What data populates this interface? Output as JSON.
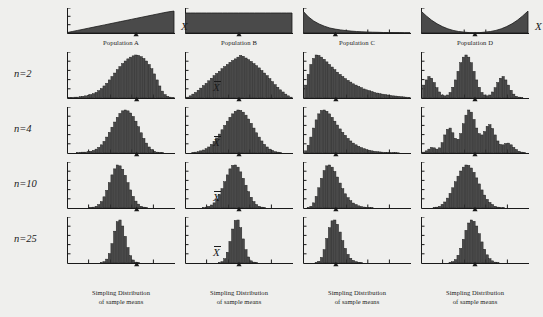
{
  "figure": {
    "background_color": "#efefed",
    "ink_color": "#1a1a1a",
    "fill_color": "#4a4a4a",
    "x_axis_label": "X",
    "mean_label": "X",
    "row_labels": [
      "n=2",
      "n=4",
      "n=10",
      "n=25"
    ],
    "sample_sizes": [
      2,
      4,
      10,
      25
    ],
    "caption_line1": "Simpling Distribution",
    "caption_line2": "of sample means"
  },
  "chart_data": [
    {
      "type": "area",
      "title": "Population A",
      "shape": "triangular-increasing",
      "xlabel": "X",
      "ylabel": "",
      "grid": false,
      "legend": "none",
      "x": [
        0,
        1,
        2,
        3,
        4,
        5,
        6,
        7,
        8,
        9,
        10,
        11,
        12,
        13,
        14,
        15,
        16,
        17,
        18,
        19,
        20
      ],
      "values": [
        0.02,
        0.07,
        0.12,
        0.17,
        0.22,
        0.27,
        0.32,
        0.37,
        0.42,
        0.47,
        0.52,
        0.57,
        0.62,
        0.67,
        0.72,
        0.77,
        0.82,
        0.87,
        0.92,
        0.97,
        1.0
      ],
      "mean_marker_x": 0.64,
      "xlim": [
        0,
        20
      ],
      "ylim": [
        0,
        1.05
      ]
    },
    {
      "type": "area",
      "title": "Population B",
      "shape": "uniform-rectangular",
      "xlabel": "X",
      "ylabel": "",
      "grid": false,
      "legend": "none",
      "x": [
        0,
        1,
        2,
        3,
        4,
        5,
        6,
        7,
        8,
        9,
        10,
        11,
        12,
        13,
        14,
        15,
        16,
        17,
        18,
        19,
        20
      ],
      "values": [
        1,
        1,
        1,
        1,
        1,
        1,
        1,
        1,
        1,
        1,
        1,
        1,
        1,
        1,
        1,
        1,
        1,
        1,
        1,
        1,
        1
      ],
      "mean_marker_x": 0.5,
      "xlim": [
        0,
        20
      ],
      "ylim": [
        0,
        1.15
      ]
    },
    {
      "type": "area",
      "title": "Population C",
      "shape": "exponential-decay",
      "xlabel": "X",
      "ylabel": "",
      "grid": false,
      "legend": "none",
      "x": [
        0,
        1,
        2,
        3,
        4,
        5,
        6,
        7,
        8,
        9,
        10,
        11,
        12,
        13,
        14,
        15,
        16,
        17,
        18,
        19,
        20
      ],
      "values": [
        1.0,
        0.74,
        0.55,
        0.41,
        0.31,
        0.23,
        0.18,
        0.14,
        0.11,
        0.085,
        0.067,
        0.054,
        0.044,
        0.036,
        0.03,
        0.025,
        0.022,
        0.019,
        0.017,
        0.015,
        0.014
      ],
      "mean_marker_x": 0.3,
      "xlim": [
        0,
        20
      ],
      "ylim": [
        0,
        1.05
      ]
    },
    {
      "type": "area",
      "title": "Population D",
      "shape": "u-shaped-bimodal",
      "xlabel": "X",
      "ylabel": "",
      "grid": false,
      "legend": "none",
      "x": [
        0,
        1,
        2,
        3,
        4,
        5,
        6,
        7,
        8,
        9,
        10,
        11,
        12,
        13,
        14,
        15,
        16,
        17,
        18,
        19,
        20
      ],
      "values": [
        1.0,
        0.78,
        0.58,
        0.42,
        0.29,
        0.19,
        0.12,
        0.07,
        0.04,
        0.02,
        0.015,
        0.02,
        0.04,
        0.07,
        0.12,
        0.19,
        0.29,
        0.42,
        0.58,
        0.78,
        1.0
      ],
      "mean_marker_x": 0.5,
      "xlim": [
        0,
        20
      ],
      "ylim": [
        0,
        1.05
      ]
    },
    {
      "type": "bar",
      "title": "Sampling distribution, Population A, n=2",
      "population": "A",
      "n": 2,
      "xlabel": "X",
      "ylabel": "",
      "grid": false,
      "legend": "none",
      "mean_marker_x": 0.645,
      "values": [
        0.01,
        0.01,
        0.02,
        0.02,
        0.03,
        0.04,
        0.05,
        0.06,
        0.08,
        0.1,
        0.13,
        0.17,
        0.22,
        0.28,
        0.34,
        0.42,
        0.5,
        0.58,
        0.66,
        0.73,
        0.8,
        0.86,
        0.91,
        0.95,
        0.98,
        1.0,
        0.99,
        0.96,
        0.92,
        0.86,
        0.78,
        0.68,
        0.56,
        0.42,
        0.28,
        0.16,
        0.08,
        0.04,
        0.02,
        0.01
      ]
    },
    {
      "type": "bar",
      "title": "Sampling distribution, Population A, n=4",
      "population": "A",
      "n": 4,
      "xlabel": "X",
      "ylabel": "",
      "grid": false,
      "legend": "none",
      "mean_marker_x": 0.645,
      "values": [
        0.0,
        0.0,
        0.0,
        0.01,
        0.01,
        0.02,
        0.02,
        0.03,
        0.04,
        0.06,
        0.09,
        0.13,
        0.19,
        0.27,
        0.37,
        0.48,
        0.6,
        0.72,
        0.83,
        0.92,
        0.98,
        1.0,
        0.98,
        0.93,
        0.85,
        0.74,
        0.61,
        0.47,
        0.34,
        0.23,
        0.14,
        0.08,
        0.04,
        0.02,
        0.01,
        0.01,
        0.0,
        0.0,
        0.0,
        0.0
      ]
    },
    {
      "type": "bar",
      "title": "Sampling distribution, Population A, n=10",
      "population": "A",
      "n": 10,
      "xlabel": "X",
      "ylabel": "",
      "grid": false,
      "legend": "none",
      "mean_marker_x": 0.645,
      "values": [
        0.0,
        0.0,
        0.0,
        0.0,
        0.0,
        0.0,
        0.0,
        0.0,
        0.01,
        0.02,
        0.04,
        0.08,
        0.15,
        0.26,
        0.41,
        0.59,
        0.77,
        0.91,
        1.0,
        0.98,
        0.9,
        0.76,
        0.59,
        0.42,
        0.27,
        0.16,
        0.09,
        0.04,
        0.02,
        0.01,
        0.0,
        0.0,
        0.0,
        0.0,
        0.0,
        0.0,
        0.0,
        0.0,
        0.0,
        0.0
      ]
    },
    {
      "type": "bar",
      "title": "Sampling distribution, Population A, n=25",
      "population": "A",
      "n": 25,
      "xlabel": "X",
      "ylabel": "",
      "grid": false,
      "legend": "none",
      "mean_marker_x": 0.645,
      "values": [
        0.0,
        0.0,
        0.0,
        0.0,
        0.0,
        0.0,
        0.0,
        0.0,
        0.0,
        0.0,
        0.0,
        0.0,
        0.01,
        0.03,
        0.09,
        0.22,
        0.45,
        0.74,
        0.96,
        1.0,
        0.86,
        0.62,
        0.36,
        0.17,
        0.07,
        0.02,
        0.01,
        0.0,
        0.0,
        0.0,
        0.0,
        0.0,
        0.0,
        0.0,
        0.0,
        0.0,
        0.0,
        0.0,
        0.0,
        0.0
      ]
    },
    {
      "type": "bar",
      "title": "Sampling distribution, Population B, n=2",
      "population": "B",
      "n": 2,
      "xlabel": "X",
      "ylabel": "",
      "grid": false,
      "legend": "none",
      "mean_marker_x": 0.5,
      "values": [
        0.02,
        0.05,
        0.09,
        0.13,
        0.18,
        0.23,
        0.29,
        0.34,
        0.4,
        0.46,
        0.52,
        0.57,
        0.62,
        0.68,
        0.73,
        0.78,
        0.83,
        0.87,
        0.91,
        0.95,
        0.99,
        0.97,
        0.93,
        0.89,
        0.85,
        0.8,
        0.75,
        0.7,
        0.64,
        0.58,
        0.52,
        0.45,
        0.38,
        0.31,
        0.25,
        0.19,
        0.14,
        0.09,
        0.05,
        0.02
      ]
    },
    {
      "type": "bar",
      "title": "Sampling distribution, Population B, n=4",
      "population": "B",
      "n": 4,
      "xlabel": "X",
      "ylabel": "",
      "grid": false,
      "legend": "none",
      "mean_marker_x": 0.5,
      "values": [
        0.0,
        0.0,
        0.01,
        0.02,
        0.03,
        0.05,
        0.07,
        0.1,
        0.14,
        0.2,
        0.27,
        0.35,
        0.44,
        0.54,
        0.64,
        0.74,
        0.83,
        0.91,
        0.97,
        1.0,
        0.99,
        0.95,
        0.88,
        0.79,
        0.69,
        0.58,
        0.47,
        0.37,
        0.28,
        0.2,
        0.14,
        0.09,
        0.06,
        0.03,
        0.02,
        0.01,
        0.0,
        0.0,
        0.0,
        0.0
      ]
    },
    {
      "type": "bar",
      "title": "Sampling distribution, Population B, n=10",
      "population": "B",
      "n": 10,
      "xlabel": "X",
      "ylabel": "",
      "grid": false,
      "legend": "none",
      "mean_marker_x": 0.5,
      "values": [
        0.0,
        0.0,
        0.0,
        0.0,
        0.0,
        0.0,
        0.01,
        0.02,
        0.04,
        0.07,
        0.12,
        0.2,
        0.31,
        0.45,
        0.61,
        0.77,
        0.91,
        0.99,
        1.0,
        0.95,
        0.84,
        0.69,
        0.53,
        0.38,
        0.25,
        0.15,
        0.08,
        0.04,
        0.02,
        0.01,
        0.0,
        0.0,
        0.0,
        0.0,
        0.0,
        0.0,
        0.0,
        0.0,
        0.0,
        0.0
      ]
    },
    {
      "type": "bar",
      "title": "Sampling distribution, Population B, n=25",
      "population": "B",
      "n": 25,
      "xlabel": "X",
      "ylabel": "",
      "grid": false,
      "legend": "none",
      "mean_marker_x": 0.5,
      "values": [
        0.0,
        0.0,
        0.0,
        0.0,
        0.0,
        0.0,
        0.0,
        0.0,
        0.0,
        0.0,
        0.0,
        0.0,
        0.01,
        0.03,
        0.1,
        0.25,
        0.5,
        0.79,
        0.99,
        1.0,
        0.82,
        0.56,
        0.31,
        0.14,
        0.05,
        0.02,
        0.01,
        0.0,
        0.0,
        0.0,
        0.0,
        0.0,
        0.0,
        0.0,
        0.0,
        0.0,
        0.0,
        0.0,
        0.0,
        0.0
      ]
    },
    {
      "type": "bar",
      "title": "Sampling distribution, Population C, n=2",
      "population": "C",
      "n": 2,
      "xlabel": "X",
      "ylabel": "",
      "grid": false,
      "legend": "none",
      "mean_marker_x": 0.305,
      "values": [
        0.3,
        0.55,
        0.78,
        0.92,
        1.0,
        0.99,
        0.95,
        0.9,
        0.84,
        0.78,
        0.72,
        0.66,
        0.6,
        0.55,
        0.5,
        0.45,
        0.41,
        0.37,
        0.33,
        0.3,
        0.27,
        0.24,
        0.21,
        0.19,
        0.17,
        0.15,
        0.13,
        0.115,
        0.1,
        0.09,
        0.08,
        0.07,
        0.06,
        0.05,
        0.045,
        0.04,
        0.03,
        0.025,
        0.02,
        0.015
      ]
    },
    {
      "type": "bar",
      "title": "Sampling distribution, Population C, n=4",
      "population": "C",
      "n": 4,
      "xlabel": "X",
      "ylabel": "",
      "grid": false,
      "legend": "none",
      "mean_marker_x": 0.305,
      "values": [
        0.05,
        0.18,
        0.37,
        0.58,
        0.77,
        0.91,
        0.99,
        1.0,
        0.97,
        0.91,
        0.83,
        0.74,
        0.65,
        0.56,
        0.48,
        0.41,
        0.34,
        0.28,
        0.23,
        0.19,
        0.155,
        0.125,
        0.1,
        0.08,
        0.065,
        0.05,
        0.04,
        0.03,
        0.025,
        0.02,
        0.015,
        0.012,
        0.01,
        0.008,
        0.006,
        0.005,
        0.004,
        0.003,
        0.002,
        0.002
      ]
    },
    {
      "type": "bar",
      "title": "Sampling distribution, Population C, n=10",
      "population": "C",
      "n": 10,
      "xlabel": "X",
      "ylabel": "",
      "grid": false,
      "legend": "none",
      "mean_marker_x": 0.305,
      "values": [
        0.0,
        0.01,
        0.04,
        0.12,
        0.27,
        0.47,
        0.69,
        0.87,
        0.98,
        1.0,
        0.95,
        0.85,
        0.72,
        0.58,
        0.45,
        0.33,
        0.24,
        0.17,
        0.115,
        0.08,
        0.05,
        0.034,
        0.022,
        0.015,
        0.01,
        0.006,
        0.004,
        0.003,
        0.002,
        0.001,
        0.0,
        0.0,
        0.0,
        0.0,
        0.0,
        0.0,
        0.0,
        0.0,
        0.0,
        0.0
      ]
    },
    {
      "type": "bar",
      "title": "Sampling distribution, Population C, n=25",
      "population": "C",
      "n": 25,
      "xlabel": "X",
      "ylabel": "",
      "grid": false,
      "legend": "none",
      "mean_marker_x": 0.305,
      "values": [
        0.0,
        0.0,
        0.0,
        0.0,
        0.01,
        0.04,
        0.13,
        0.31,
        0.57,
        0.82,
        0.98,
        1.0,
        0.9,
        0.72,
        0.52,
        0.34,
        0.2,
        0.11,
        0.06,
        0.03,
        0.015,
        0.008,
        0.004,
        0.002,
        0.001,
        0.0,
        0.0,
        0.0,
        0.0,
        0.0,
        0.0,
        0.0,
        0.0,
        0.0,
        0.0,
        0.0,
        0.0,
        0.0,
        0.0,
        0.0
      ]
    },
    {
      "type": "bar",
      "title": "Sampling distribution, Population D, n=2",
      "population": "D",
      "n": 2,
      "xlabel": "X",
      "ylabel": "",
      "grid": false,
      "legend": "none",
      "mean_marker_x": 0.5,
      "values": [
        0.3,
        0.42,
        0.5,
        0.46,
        0.36,
        0.24,
        0.14,
        0.07,
        0.05,
        0.07,
        0.13,
        0.25,
        0.42,
        0.62,
        0.82,
        0.95,
        1.0,
        0.95,
        0.82,
        0.62,
        0.42,
        0.25,
        0.13,
        0.07,
        0.05,
        0.07,
        0.14,
        0.24,
        0.36,
        0.46,
        0.5,
        0.42,
        0.3,
        0.18,
        0.09,
        0.04,
        0.02,
        0.01,
        0.0,
        0.0
      ]
    },
    {
      "type": "bar",
      "title": "Sampling distribution, Population D, n=4",
      "population": "D",
      "n": 4,
      "xlabel": "X",
      "ylabel": "",
      "grid": false,
      "legend": "none",
      "mean_marker_x": 0.5,
      "values": [
        0.02,
        0.05,
        0.09,
        0.13,
        0.12,
        0.09,
        0.12,
        0.24,
        0.42,
        0.55,
        0.58,
        0.47,
        0.34,
        0.32,
        0.45,
        0.68,
        0.88,
        1.0,
        0.95,
        0.78,
        0.58,
        0.45,
        0.42,
        0.5,
        0.62,
        0.66,
        0.57,
        0.42,
        0.28,
        0.2,
        0.19,
        0.22,
        0.23,
        0.19,
        0.13,
        0.08,
        0.04,
        0.02,
        0.01,
        0.0
      ]
    },
    {
      "type": "bar",
      "title": "Sampling distribution, Population D, n=10",
      "population": "D",
      "n": 10,
      "xlabel": "X",
      "ylabel": "",
      "grid": false,
      "legend": "none",
      "mean_marker_x": 0.5,
      "values": [
        0.0,
        0.0,
        0.0,
        0.0,
        0.01,
        0.02,
        0.04,
        0.08,
        0.14,
        0.23,
        0.34,
        0.47,
        0.61,
        0.74,
        0.86,
        0.95,
        1.0,
        0.99,
        0.93,
        0.83,
        0.7,
        0.56,
        0.42,
        0.3,
        0.2,
        0.13,
        0.08,
        0.04,
        0.02,
        0.01,
        0.01,
        0.0,
        0.0,
        0.0,
        0.0,
        0.0,
        0.0,
        0.0,
        0.0,
        0.0
      ]
    },
    {
      "type": "bar",
      "title": "Sampling distribution, Population D, n=25",
      "population": "D",
      "n": 25,
      "xlabel": "X",
      "ylabel": "",
      "grid": false,
      "legend": "none",
      "mean_marker_x": 0.5,
      "values": [
        0.0,
        0.0,
        0.0,
        0.0,
        0.0,
        0.0,
        0.0,
        0.0,
        0.0,
        0.0,
        0.01,
        0.03,
        0.08,
        0.18,
        0.34,
        0.55,
        0.76,
        0.93,
        1.0,
        0.97,
        0.86,
        0.68,
        0.49,
        0.32,
        0.19,
        0.1,
        0.05,
        0.02,
        0.01,
        0.0,
        0.0,
        0.0,
        0.0,
        0.0,
        0.0,
        0.0,
        0.0,
        0.0,
        0.0,
        0.0
      ]
    }
  ]
}
